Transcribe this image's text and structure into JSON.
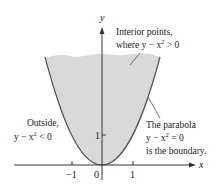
{
  "figure": {
    "type": "region-diagram",
    "colors": {
      "region_fill": "#d9d9d9",
      "boundary": "#555555",
      "axis": "#333333",
      "text": "#222222"
    },
    "axes": {
      "x_label": "x",
      "y_label": "y",
      "x_ticks": [
        "−1",
        "0",
        "1"
      ],
      "y_ticks": [
        "1"
      ]
    },
    "annotations": {
      "interior_line1": "Interior points,",
      "interior_line2_prefix": "where y − x",
      "interior_line2_exp": "2",
      "interior_line2_suffix": " > 0",
      "outside_line1": "Outside,",
      "outside_line2_prefix": "y − x",
      "outside_line2_exp": "2",
      "outside_line2_suffix": " < 0",
      "boundary_line1": "The parabola",
      "boundary_line2_prefix": "y − x",
      "boundary_line2_exp": "2",
      "boundary_line2_suffix": " = 0",
      "boundary_line3": "is the boundary."
    }
  }
}
